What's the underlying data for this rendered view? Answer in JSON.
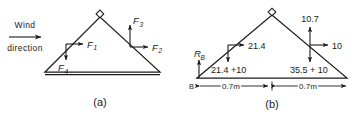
{
  "figure": {
    "panels": [
      {
        "id": "panel-a",
        "caption": "(a)",
        "wind": {
          "line1": "Wind",
          "line2": "direction",
          "arrow": "right-arrow-icon"
        },
        "forces": [
          {
            "name": "F1",
            "base": "F",
            "sub": "1",
            "direction": "right"
          },
          {
            "name": "F2",
            "base": "F",
            "sub": "2",
            "direction": "right"
          },
          {
            "name": "F3",
            "base": "F",
            "sub": "3",
            "direction": "up"
          },
          {
            "name": "F4",
            "base": "F",
            "sub": "4",
            "direction": "down"
          }
        ]
      },
      {
        "id": "panel-b",
        "caption": "(b)",
        "reaction": {
          "base": "R",
          "sub": "B",
          "direction": "up"
        },
        "node_label": "B",
        "loads": [
          {
            "value": "21.4",
            "direction": "right",
            "side": "windward"
          },
          {
            "value": "21.4 +10",
            "direction": "down",
            "side": "windward"
          },
          {
            "value": "10.7",
            "direction": "up",
            "side": "leeward"
          },
          {
            "value": "10",
            "direction": "right",
            "side": "leeward"
          },
          {
            "value": "35.5 + 10",
            "direction": "down",
            "side": "leeward"
          }
        ],
        "dimensions": [
          {
            "value": "0.7m",
            "span": "left-half"
          },
          {
            "value": "0.7m",
            "span": "right-half"
          }
        ]
      }
    ],
    "colors": {
      "ink": "#1a1a1a",
      "background": "#ffffff"
    }
  }
}
